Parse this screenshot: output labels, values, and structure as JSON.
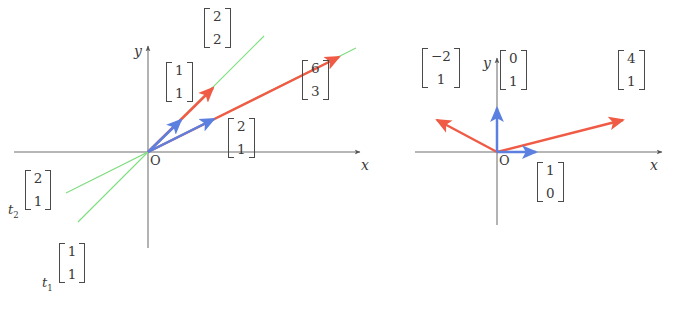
{
  "figure": {
    "type": "vector-diagram",
    "background": "#ffffff",
    "colors": {
      "axis": "#555555",
      "red": "#ef5b45",
      "blue": "#5b80e0",
      "green": "#6fd96f",
      "text": "#3a3a3a"
    }
  },
  "panels": [
    {
      "id": "left",
      "name": "scalar-multiples-panel",
      "origin_label": "O",
      "x_axis_label": "x",
      "y_axis_label": "y",
      "vectors": [
        {
          "name": "v-1-1",
          "color": "blue",
          "components": [
            1,
            1
          ],
          "label": "[1,1]"
        },
        {
          "name": "v-2-2",
          "color": "red",
          "components": [
            2,
            2
          ],
          "label": "[2,2]"
        },
        {
          "name": "v-2-1",
          "color": "blue",
          "components": [
            2,
            1
          ],
          "label": "[2,1]"
        },
        {
          "name": "v-6-3",
          "color": "red",
          "components": [
            6,
            3
          ],
          "label": "[6,3]"
        }
      ],
      "spanning_lines": [
        {
          "name": "line-t1",
          "color": "green",
          "direction": [
            1,
            1
          ],
          "label_scalar": "t",
          "label_sub": "1",
          "label_vector": [
            1,
            1
          ]
        },
        {
          "name": "line-t2",
          "color": "green",
          "direction": [
            2,
            1
          ],
          "label_scalar": "t",
          "label_sub": "2",
          "label_vector": [
            2,
            1
          ]
        }
      ],
      "labels": {
        "v11_top": "1",
        "v11_bot": "1",
        "v22_top": "2",
        "v22_bot": "2",
        "v21_top": "2",
        "v21_bot": "1",
        "v63_top": "6",
        "v63_bot": "3",
        "t1_scalar": "t",
        "t1_sub": "1",
        "t1_top": "1",
        "t1_bot": "1",
        "t2_scalar": "t",
        "t2_sub": "2",
        "t2_top": "2",
        "t2_bot": "1"
      }
    },
    {
      "id": "right",
      "name": "basis-vectors-panel",
      "origin_label": "O",
      "x_axis_label": "x",
      "y_axis_label": "y",
      "vectors": [
        {
          "name": "e2-0-1",
          "color": "blue",
          "components": [
            0,
            1
          ],
          "label": "[0,1]"
        },
        {
          "name": "e1-1-0",
          "color": "blue",
          "components": [
            1,
            0
          ],
          "label": "[1,0]"
        },
        {
          "name": "v-neg2-1",
          "color": "red",
          "components": [
            -2,
            1
          ],
          "label": "[-2,1]"
        },
        {
          "name": "v-4-1",
          "color": "red",
          "components": [
            4,
            1
          ],
          "label": "[4,1]"
        }
      ],
      "labels": {
        "e2_top": "0",
        "e2_bot": "1",
        "e1_top": "1",
        "e1_bot": "0",
        "vn21_top": "−2",
        "vn21_bot": "1",
        "v41_top": "4",
        "v41_bot": "1"
      }
    }
  ]
}
